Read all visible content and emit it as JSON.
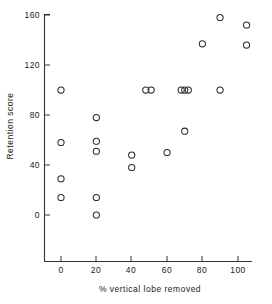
{
  "chart_data": {
    "type": "scatter",
    "title": "",
    "xlabel": "% vertical lobe removed",
    "ylabel": "Retention score",
    "xlim": [
      -8,
      108
    ],
    "ylim": [
      -16,
      168
    ],
    "xticks": [
      0,
      20,
      40,
      60,
      80,
      100
    ],
    "yticks": [
      0,
      40,
      80,
      120,
      160
    ],
    "xtick_labels": [
      "0",
      "20",
      "40",
      "60",
      "80",
      "100"
    ],
    "ytick_labels": [
      "0",
      "40",
      "80",
      "120",
      "160"
    ],
    "grid": false,
    "legend": null,
    "marker": "open-circle",
    "points": [
      {
        "x": 0,
        "y": 100
      },
      {
        "x": 0,
        "y": 58
      },
      {
        "x": 0,
        "y": 29
      },
      {
        "x": 0,
        "y": 14
      },
      {
        "x": 20,
        "y": 78
      },
      {
        "x": 20,
        "y": 59
      },
      {
        "x": 20,
        "y": 51
      },
      {
        "x": 20,
        "y": 14
      },
      {
        "x": 20,
        "y": 0
      },
      {
        "x": 40,
        "y": 48
      },
      {
        "x": 40,
        "y": 38
      },
      {
        "x": 48,
        "y": 100
      },
      {
        "x": 51,
        "y": 100
      },
      {
        "x": 60,
        "y": 50
      },
      {
        "x": 68,
        "y": 100
      },
      {
        "x": 70,
        "y": 100
      },
      {
        "x": 72,
        "y": 100
      },
      {
        "x": 70,
        "y": 67
      },
      {
        "x": 80,
        "y": 137
      },
      {
        "x": 90,
        "y": 100
      },
      {
        "x": 90,
        "y": 158
      },
      {
        "x": 105,
        "y": 152
      },
      {
        "x": 105,
        "y": 136
      }
    ]
  }
}
